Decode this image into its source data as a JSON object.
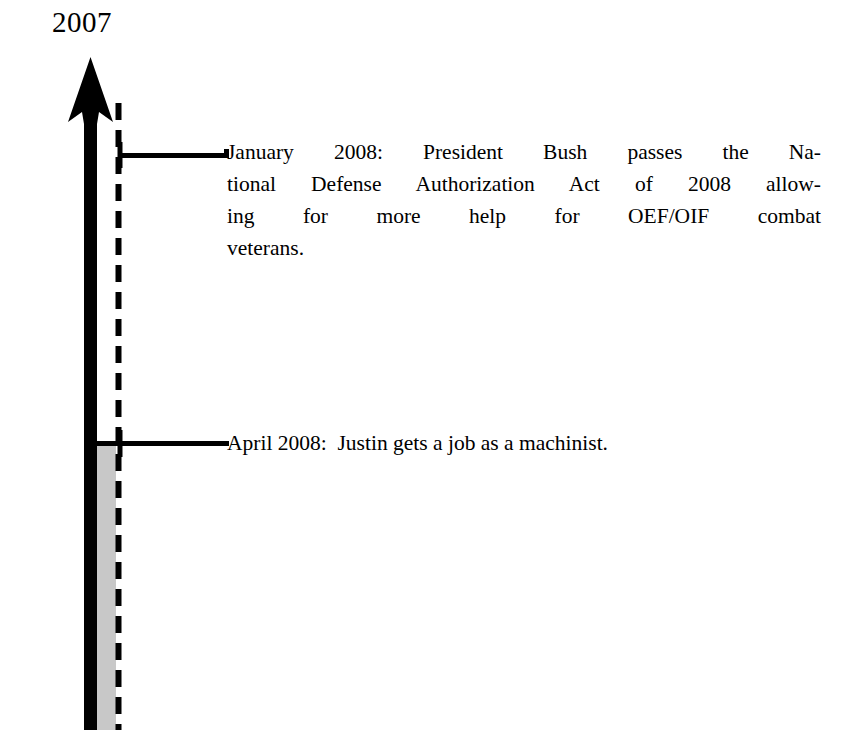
{
  "figure": {
    "type": "vertical-timeline",
    "background_color": "#ffffff",
    "ink_color": "#000000",
    "shaded_band_color": "#c8c8c8",
    "start_year_label": "2007",
    "direction": "upward"
  },
  "axis": {
    "arrow_name": "timeline-arrow",
    "arrow_tip_y": 58,
    "arrow_base_y": 730,
    "arrow_head_base_y": 122,
    "solid_line_x": 90,
    "dashed_line_x": 118,
    "dashed_line_start_y": 103,
    "dash_length": 17,
    "dash_gap": 10,
    "shaded_band_start_y": 443,
    "shaded_band_end_y": 730,
    "shaded_band_left": 97,
    "shaded_band_right": 116
  },
  "events": [
    {
      "id": "event-january-2008",
      "date_label": "January 2008:",
      "connector_y": 155,
      "connector_from_x": 118,
      "connector_to_x": 228,
      "lines": [
        "January 2008:  President Bush passes the Na-",
        "tional Defense Authorization Act of 2008 allow-",
        "ing for more help for OEF/OIF combat",
        "veterans."
      ],
      "full_text": "January 2008: President Bush passes the National Defense Authorization Act of 2008 allowing for more help for OEF/OIF combat veterans."
    },
    {
      "id": "event-april-2008",
      "date_label": "April 2008:",
      "connector_y": 443,
      "connector_from_x": 110,
      "connector_to_x": 228,
      "lines": [
        "April 2008:  Justin gets a job as a machinist."
      ],
      "full_text": "April 2008: Justin gets a job as a machinist."
    }
  ]
}
